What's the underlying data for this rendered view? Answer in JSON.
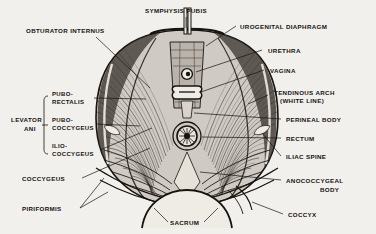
{
  "figure": {
    "background_color": "#f2f0ec",
    "ink_color": "#17140f"
  },
  "labels": {
    "obturator_internus": "OBTURATOR INTERNUS",
    "symphysis_pubis": "SYMPHYSIS PUBIS",
    "urogenital_diaphragm": "UROGENITAL DIAPHRAGM",
    "urethra": "URETHRA",
    "vagina": "VAGINA",
    "tendinous_arch_line1": "TENDINOUS ARCH",
    "tendinous_arch_line2": "(WHITE LINE)",
    "perineal_body": "PERINEAL BODY",
    "rectum": "RECTUM",
    "iliac_spine": "ILIAC SPINE",
    "anococcygeal_line1": "ANOCOCCYGEAL",
    "anococcygeal_line2": "BODY",
    "coccyx": "COCCYX",
    "sacrum": "SACRUM",
    "piriformis": "PIRIFORMIS",
    "coccygeus": "COCCYGEUS",
    "levator_ani_line1": "LEVATOR",
    "levator_ani_line2": "ANI",
    "pubo_rectalis_line1": "PUBO-",
    "pubo_rectalis_line2": "RECTALIS",
    "pubo_coccygeus_line1": "PUBO-",
    "pubo_coccygeus_line2": "COCCYGEUS",
    "ilio_coccygeus_line1": "ILIO-",
    "ilio_coccygeus_line2": "COCCYGEUS"
  }
}
